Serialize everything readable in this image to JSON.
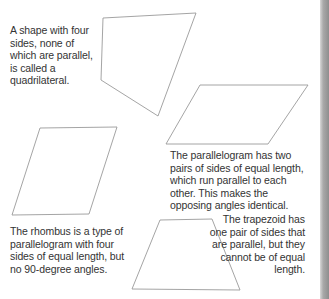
{
  "captions": {
    "quadrilateral": "A shape with four sides, none of which are parallel, is called a quadrilateral.",
    "parallelogram": "The parallelogram has two pairs of sides of equal length, which run parallel to each other. This makes the opposing angles identical.",
    "rhombus": "The rhombus is a type of parallelogram with four sides of equal length, but no 90-degree angles.",
    "trapezoid": "The trapezoid has one pair of sides that are parallel, but they cannot be of equal length."
  },
  "shapes": {
    "quadrilateral": {
      "label": "quadrilateral",
      "points": "103,18 196,13 158,116 101,80"
    },
    "parallelogram": {
      "label": "parallelogram",
      "points": "200,85 308,85 268,144 166,144"
    },
    "rhombus": {
      "label": "rhombus",
      "points": "40,128 117,127 89,214 12,215"
    },
    "trapezoid": {
      "label": "trapezoid",
      "points": "160,220 212,219 240,290 132,289"
    }
  },
  "colors": {
    "stroke": "#9a9a9a",
    "text": "#333333",
    "background": "#ffffff",
    "edge_strip": "#8e8e8e"
  }
}
